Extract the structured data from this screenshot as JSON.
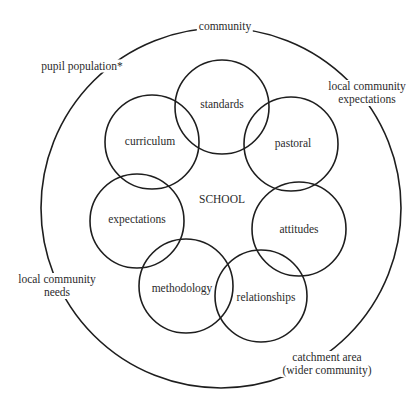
{
  "diagram": {
    "center_label": "SCHOOL",
    "outer_ring": {
      "top_label": "community",
      "labels": [
        {
          "id": "pupil-population",
          "lines": [
            "pupil population*"
          ]
        },
        {
          "id": "local-community-expectations",
          "lines": [
            "local community",
            "expectations"
          ]
        },
        {
          "id": "local-community-needs",
          "lines": [
            "local community",
            "needs"
          ]
        },
        {
          "id": "catchment-area",
          "lines": [
            "catchment area",
            "(wider community)"
          ]
        }
      ]
    },
    "circles": [
      {
        "label": "standards",
        "cx": 222,
        "cy": 107,
        "r": 47
      },
      {
        "label": "pastoral",
        "cx": 291,
        "cy": 144,
        "r": 47
      },
      {
        "label": "attitudes",
        "cx": 299,
        "cy": 229,
        "r": 47
      },
      {
        "label": "relationships",
        "cx": 261,
        "cy": 296,
        "r": 46
      },
      {
        "label": "methodology",
        "cx": 186,
        "cy": 286,
        "r": 47
      },
      {
        "label": "expectations",
        "cx": 137,
        "cy": 221,
        "r": 47
      },
      {
        "label": "curriculum",
        "cx": 152,
        "cy": 142,
        "r": 47
      }
    ],
    "stroke_color": "#1e1e1e",
    "background": "#ffffff"
  }
}
